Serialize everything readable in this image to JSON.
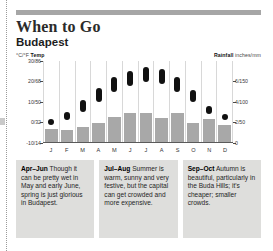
{
  "header": {
    "title": "When to Go",
    "subtitle": "Budapest"
  },
  "chart_data": {
    "type": "bar",
    "title": "When to Go",
    "subtitle": "Budapest",
    "categories": [
      "J",
      "F",
      "M",
      "A",
      "M",
      "J",
      "J",
      "A",
      "S",
      "O",
      "N",
      "D"
    ],
    "left_axis": {
      "label_unit": "°C/°F",
      "label_name": "Temp",
      "ticks": [
        "30/86",
        "20/68",
        "10/50",
        "0/32",
        "-10/14"
      ],
      "values": [
        30,
        20,
        10,
        0,
        -10
      ],
      "ylim": [
        -10,
        30
      ]
    },
    "right_axis": {
      "label_name": "Rainfall",
      "label_unit": "inches/mm",
      "ticks": [
        "6/150",
        "4/100",
        "2/50",
        "0"
      ],
      "values": [
        6,
        4,
        2,
        0
      ],
      "ylim": [
        0,
        8
      ]
    },
    "grid": false,
    "legend": "none",
    "series": [
      {
        "name": "Rainfall",
        "type": "bar",
        "unit": "inches",
        "values": [
          1.4,
          1.3,
          1.6,
          2.0,
          2.5,
          2.9,
          2.9,
          2.4,
          2.9,
          2.0,
          2.3,
          1.8
        ]
      },
      {
        "name": "Temperature range",
        "type": "range",
        "unit": "°C",
        "low": [
          -1,
          1,
          5,
          10,
          15,
          18,
          20,
          19,
          15,
          10,
          4,
          1
        ],
        "high": [
          2,
          5,
          11,
          17,
          22,
          25,
          27,
          26,
          22,
          16,
          8,
          4
        ]
      }
    ]
  },
  "notes": [
    {
      "period": "Apr–Jun",
      "text": " Though it can be pretty wet in May and early June, spring is just glorious in Budapest."
    },
    {
      "period": "Jul–Aug",
      "text": " Summer is warm, sunny and very festive, but the capital can get crowded and more expensive."
    },
    {
      "period": "Sep–Oct",
      "text": " Autumn is beautiful, particularly in the Buda Hills; it's cheaper; smaller crowds."
    }
  ]
}
